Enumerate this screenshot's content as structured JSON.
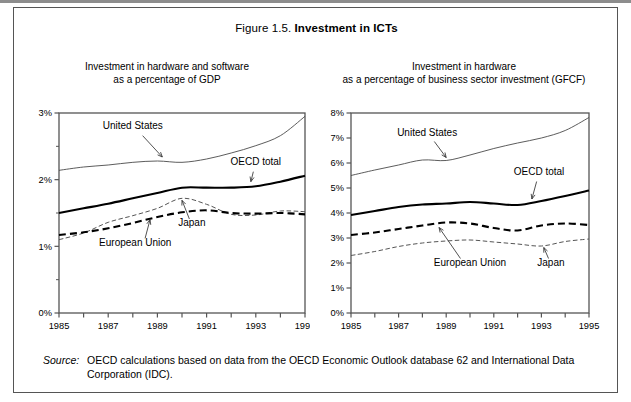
{
  "figure": {
    "number": "Figure 1.5.",
    "title": "Investment in ICTs"
  },
  "panels": {
    "left": {
      "caption_line1": "Investment in hardware and software",
      "caption_line2": "as a percentage of GDP"
    },
    "right": {
      "caption_line1": "Investment in hardware",
      "caption_line2": "as a percentage of business sector investment (GFCF)"
    }
  },
  "annotations": {
    "united_states": "United States",
    "oecd_total": "OECD total",
    "japan": "Japan",
    "european_union": "European Union"
  },
  "source": {
    "label": "Source:",
    "text": "OECD calculations based on data from the OECD Economic Outlook database 62 and International Data Corporation (IDC)."
  },
  "colors": {
    "frame": "#555555",
    "line_dark": "#000000",
    "line_light": "#555555",
    "background": "#ffffff"
  },
  "chart_data": [
    {
      "id": "left",
      "type": "line",
      "title": "Investment in hardware and software as a percentage of GDP",
      "xlabel": "",
      "ylabel": "",
      "x": [
        1985,
        1986,
        1987,
        1988,
        1989,
        1990,
        1991,
        1992,
        1993,
        1994,
        1995
      ],
      "xlim": [
        1985,
        1995
      ],
      "ylim": [
        0,
        3
      ],
      "yticks": [
        0,
        1,
        2,
        3
      ],
      "ytick_labels": [
        "0%",
        "1%",
        "2%",
        "3%"
      ],
      "yticks_minor": [
        0.5,
        1.5,
        2.5
      ],
      "xticks": [
        1985,
        1986,
        1987,
        1988,
        1989,
        1990,
        1991,
        1992,
        1993,
        1994,
        1995
      ],
      "xtick_labels": [
        "1985",
        "",
        "1987",
        "",
        "1989",
        "",
        "1991",
        "",
        "1993",
        "",
        "1995"
      ],
      "grid": false,
      "legend": "annotated-inline",
      "series": [
        {
          "name": "United States",
          "style": "thin-solid",
          "values": [
            2.14,
            2.19,
            2.22,
            2.26,
            2.28,
            2.26,
            2.31,
            2.4,
            2.51,
            2.66,
            2.95
          ]
        },
        {
          "name": "OECD total",
          "style": "thick-solid",
          "values": [
            1.5,
            1.57,
            1.64,
            1.72,
            1.8,
            1.88,
            1.88,
            1.88,
            1.9,
            1.97,
            2.06
          ]
        },
        {
          "name": "European Union",
          "style": "thick-dashed",
          "values": [
            1.17,
            1.21,
            1.27,
            1.35,
            1.44,
            1.51,
            1.54,
            1.5,
            1.49,
            1.5,
            1.48
          ]
        },
        {
          "name": "Japan",
          "style": "thin-dashed",
          "values": [
            1.1,
            1.2,
            1.36,
            1.46,
            1.57,
            1.72,
            1.63,
            1.48,
            1.47,
            1.53,
            1.52
          ]
        }
      ]
    },
    {
      "id": "right",
      "type": "line",
      "title": "Investment in hardware as a percentage of business sector investment (GFCF)",
      "xlabel": "",
      "ylabel": "",
      "x": [
        1985,
        1986,
        1987,
        1988,
        1989,
        1990,
        1991,
        1992,
        1993,
        1994,
        1995
      ],
      "xlim": [
        1985,
        1995
      ],
      "ylim": [
        0,
        8
      ],
      "yticks": [
        0,
        1,
        2,
        3,
        4,
        5,
        6,
        7,
        8
      ],
      "ytick_labels": [
        "0%",
        "1%",
        "2%",
        "3%",
        "4%",
        "5%",
        "6%",
        "7%",
        "8%"
      ],
      "xticks": [
        1985,
        1986,
        1987,
        1988,
        1989,
        1990,
        1991,
        1992,
        1993,
        1994,
        1995
      ],
      "xtick_labels": [
        "1985",
        "",
        "1987",
        "",
        "1989",
        "",
        "1991",
        "",
        "1993",
        "",
        "1995"
      ],
      "grid": false,
      "legend": "annotated-inline",
      "series": [
        {
          "name": "United States",
          "style": "thin-solid",
          "values": [
            5.5,
            5.72,
            5.92,
            6.12,
            6.1,
            6.32,
            6.58,
            6.8,
            7.0,
            7.3,
            7.82
          ]
        },
        {
          "name": "OECD total",
          "style": "thick-solid",
          "values": [
            3.92,
            4.08,
            4.24,
            4.34,
            4.38,
            4.44,
            4.38,
            4.32,
            4.48,
            4.68,
            4.9
          ]
        },
        {
          "name": "European Union",
          "style": "thick-dashed",
          "values": [
            3.12,
            3.22,
            3.36,
            3.5,
            3.62,
            3.58,
            3.4,
            3.3,
            3.5,
            3.58,
            3.52
          ]
        },
        {
          "name": "Japan",
          "style": "thin-dashed",
          "values": [
            2.3,
            2.46,
            2.66,
            2.8,
            2.88,
            2.92,
            2.84,
            2.76,
            2.68,
            2.86,
            2.96
          ]
        }
      ]
    }
  ]
}
